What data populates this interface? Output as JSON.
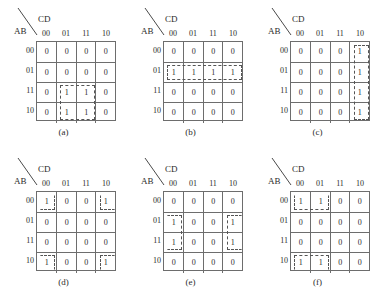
{
  "figure": {
    "axis_labels": {
      "rows": "AB",
      "cols": "CD"
    },
    "col_headers": [
      "00",
      "01",
      "11",
      "10"
    ],
    "row_headers": [
      "00",
      "01",
      "11",
      "10"
    ]
  },
  "maps": [
    {
      "caption": "(a)",
      "cells": [
        [
          "0",
          "0",
          "0",
          "0"
        ],
        [
          "0",
          "0",
          "0",
          "0"
        ],
        [
          "0",
          "1",
          "1",
          "0"
        ],
        [
          "0",
          "1",
          "1",
          "0"
        ]
      ],
      "groups": [
        {
          "name": "group-block-bc",
          "row": 2,
          "col": 1,
          "rows": 2,
          "cols": 2,
          "edges": "all"
        }
      ]
    },
    {
      "caption": "(b)",
      "cells": [
        [
          "0",
          "0",
          "0",
          "0"
        ],
        [
          "1",
          "1",
          "1",
          "1"
        ],
        [
          "0",
          "0",
          "0",
          "0"
        ],
        [
          "0",
          "0",
          "0",
          "0"
        ]
      ],
      "groups": [
        {
          "name": "group-row-01",
          "row": 1,
          "col": 0,
          "rows": 1,
          "cols": 4,
          "edges": "all"
        }
      ]
    },
    {
      "caption": "(c)",
      "cells": [
        [
          "0",
          "0",
          "0",
          "1"
        ],
        [
          "0",
          "0",
          "0",
          "1"
        ],
        [
          "0",
          "0",
          "0",
          "1"
        ],
        [
          "0",
          "0",
          "0",
          "1"
        ]
      ],
      "groups": [
        {
          "name": "group-col-10",
          "row": 0,
          "col": 3,
          "rows": 4,
          "cols": 1,
          "edges": "all"
        }
      ]
    },
    {
      "caption": "(d)",
      "cells": [
        [
          "1",
          "0",
          "0",
          "1"
        ],
        [
          "0",
          "0",
          "0",
          "0"
        ],
        [
          "0",
          "0",
          "0",
          "0"
        ],
        [
          "1",
          "0",
          "0",
          "1"
        ]
      ],
      "groups": [
        {
          "name": "group-corner-tl",
          "row": 0,
          "col": 0,
          "rows": 1,
          "cols": 1,
          "edges": "no-t no-l"
        },
        {
          "name": "group-corner-tr",
          "row": 0,
          "col": 3,
          "rows": 1,
          "cols": 1,
          "edges": "no-t no-r"
        },
        {
          "name": "group-corner-bl",
          "row": 3,
          "col": 0,
          "rows": 1,
          "cols": 1,
          "edges": "no-b no-l"
        },
        {
          "name": "group-corner-br",
          "row": 3,
          "col": 3,
          "rows": 1,
          "cols": 1,
          "edges": "no-b no-r"
        }
      ]
    },
    {
      "caption": "(e)",
      "cells": [
        [
          "0",
          "0",
          "0",
          "0"
        ],
        [
          "1",
          "0",
          "0",
          "1"
        ],
        [
          "1",
          "0",
          "0",
          "1"
        ],
        [
          "0",
          "0",
          "0",
          "0"
        ]
      ],
      "groups": [
        {
          "name": "group-pair-left",
          "row": 1,
          "col": 0,
          "rows": 2,
          "cols": 1,
          "edges": "no-l"
        },
        {
          "name": "group-pair-right",
          "row": 1,
          "col": 3,
          "rows": 2,
          "cols": 1,
          "edges": "no-r"
        }
      ]
    },
    {
      "caption": "(f)",
      "cells": [
        [
          "1",
          "1",
          "0",
          "0"
        ],
        [
          "0",
          "0",
          "0",
          "0"
        ],
        [
          "0",
          "0",
          "0",
          "0"
        ],
        [
          "1",
          "1",
          "0",
          "0"
        ]
      ],
      "groups": [
        {
          "name": "group-pair-top",
          "row": 0,
          "col": 0,
          "rows": 1,
          "cols": 2,
          "edges": "no-t"
        },
        {
          "name": "group-pair-bottom",
          "row": 3,
          "col": 0,
          "rows": 1,
          "cols": 2,
          "edges": "no-b"
        }
      ]
    }
  ]
}
